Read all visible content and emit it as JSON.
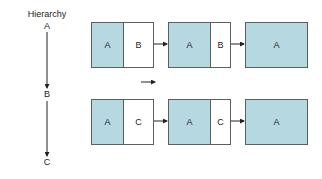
{
  "hierarchy": {
    "title": "Hierarchy",
    "levels": [
      "A",
      "B",
      "C"
    ]
  },
  "rows": [
    {
      "stages": [
        {
          "cells": [
            {
              "label": "A",
              "fill": "blue"
            },
            {
              "label": "B",
              "fill": "white"
            }
          ]
        },
        {
          "cells": [
            {
              "label": "A",
              "fill": "blue"
            },
            {
              "label": "B",
              "fill": "white"
            }
          ]
        },
        {
          "cells": [
            {
              "label": "A",
              "fill": "blue"
            }
          ]
        }
      ]
    },
    {
      "stages": [
        {
          "cells": [
            {
              "label": "A",
              "fill": "blue"
            },
            {
              "label": "C",
              "fill": "white"
            }
          ]
        },
        {
          "cells": [
            {
              "label": "A",
              "fill": "blue"
            },
            {
              "label": "C",
              "fill": "white"
            }
          ]
        },
        {
          "cells": [
            {
              "label": "A",
              "fill": "blue"
            }
          ]
        }
      ]
    }
  ],
  "colors": {
    "fill_blue": "#b6d8e1",
    "border": "#5a5f62",
    "arrow": "#222222"
  }
}
